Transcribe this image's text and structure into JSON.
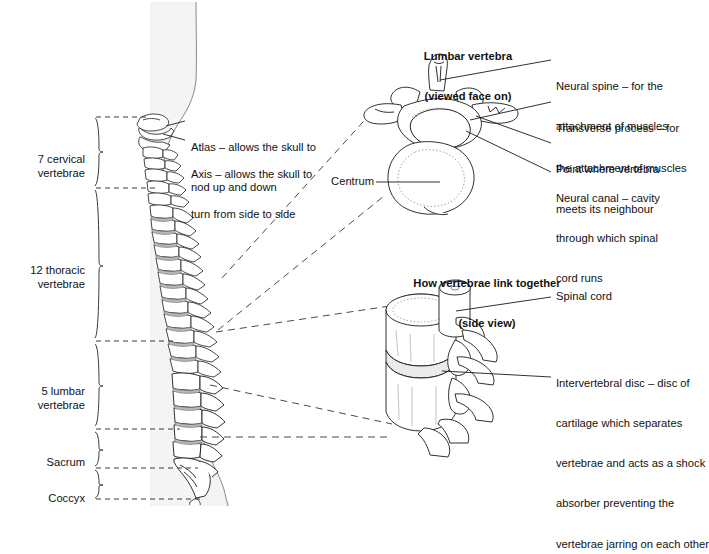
{
  "figure": {
    "background": "#ffffff",
    "ink": "#1a1a1a",
    "body_silhouette_fill": "#f2f2f2"
  },
  "spine_regions": [
    {
      "id": "cervical",
      "label": "7 cervical\nvertebrae",
      "count": 7,
      "name": "cervical vertebrae",
      "brace_top": 118,
      "brace_bottom": 186
    },
    {
      "id": "thoracic",
      "label": "12 thoracic\nvertebrae",
      "count": 12,
      "name": "thoracic vertebrae",
      "brace_top": 190,
      "brace_bottom": 338
    },
    {
      "id": "lumbar",
      "label": "5 lumbar\nvertebrae",
      "count": 5,
      "name": "lumbar vertebrae",
      "brace_top": 344,
      "brace_bottom": 426
    },
    {
      "id": "sacrum",
      "label": "Sacrum",
      "count": null,
      "name": "sacrum",
      "brace_top": 432,
      "brace_bottom": 466
    },
    {
      "id": "coccyx",
      "label": "Coccyx",
      "count": null,
      "name": "coccyx",
      "brace_top": 470,
      "brace_bottom": 498
    }
  ],
  "spine_callouts": [
    {
      "id": "atlas",
      "line1": "Atlas – allows the skull to",
      "line2": "nod up and down"
    },
    {
      "id": "axis",
      "line1": "Axis – allows the skull to",
      "line2": "turn from side to side"
    }
  ],
  "vertebra_detail": {
    "title_line1": "Lumbar vertebra",
    "title_line2": "(viewed face on)",
    "labels": [
      {
        "id": "neural-spine",
        "line1": "Neural spine – for the",
        "line2": "attachment of muscles"
      },
      {
        "id": "transverse-process",
        "line1": "Transverse process – for",
        "line2": "the attachment of muscles"
      },
      {
        "id": "meeting-point",
        "line1": "Point where vertebra",
        "line2": "meets its neighbour"
      },
      {
        "id": "neural-canal",
        "line1": "Neural canal – cavity",
        "line2": "through which spinal",
        "line3": "cord runs"
      },
      {
        "id": "centrum",
        "line1": "Centrum"
      }
    ]
  },
  "linkage_detail": {
    "title_line1": "How vertebrae link together",
    "title_line2": "(side view)",
    "labels": [
      {
        "id": "spinal-cord",
        "line1": "Spinal cord"
      },
      {
        "id": "intervertebral-disc",
        "line1": "Intervertebral disc – disc of",
        "line2": "cartilage which separates",
        "line3": "vertebrae and acts as a shock",
        "line4": "absorber preventing the",
        "line5": "vertebrae jarring on each other"
      }
    ]
  }
}
